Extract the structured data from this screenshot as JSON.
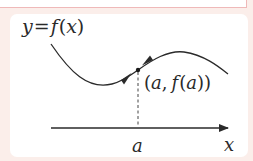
{
  "diagram": {
    "curve_label": "y = f(x)",
    "curve_label_parts": {
      "y": "y",
      "eq": "=",
      "f": "f",
      "lp": "(",
      "x": "x",
      "rp": ")"
    },
    "point_label": "(a, f(a))",
    "point_label_parts": {
      "lp": "(",
      "a1": "a",
      "comma": ",",
      "f": "f",
      "lp2": "(",
      "a2": "a",
      "rp2": ")",
      "rp": ")"
    },
    "axis_tick_label": "a",
    "axis_label": "x",
    "colors": {
      "background": "#fbeeea",
      "panel": "#ffffff",
      "border_pink": "#efb9b9",
      "ink": "#2a2a2a"
    }
  }
}
